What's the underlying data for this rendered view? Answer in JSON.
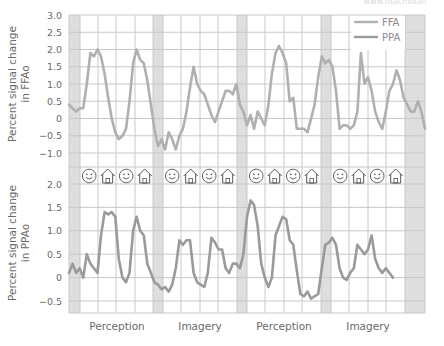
{
  "watermark": "www.macmillan",
  "colors": {
    "grid": "#c8c8c8",
    "shade": "#dedede",
    "ffa_line": "#b0b0b0",
    "ppa_line": "#9a9a9a",
    "text": "#6a6a6a"
  },
  "legend": [
    {
      "label": "FFA",
      "color": "#b0b0b0"
    },
    {
      "label": "PPA",
      "color": "#9a9a9a"
    }
  ],
  "conditions": [
    "Perception",
    "Imagery",
    "Perception",
    "Imagery"
  ],
  "stimulus_icons": [
    "face-icon",
    "house-icon",
    "face-icon",
    "house-icon",
    "face-icon",
    "house-icon",
    "face-icon",
    "house-icon",
    "face-icon",
    "house-icon",
    "face-icon",
    "house-icon",
    "face-icon",
    "house-icon",
    "face-icon",
    "house-icon"
  ],
  "chart_data": [
    {
      "type": "line",
      "title": "",
      "ylabel": "Percent signal change in FFAo",
      "xlabel": "",
      "ylim": [
        -1.0,
        3.0
      ],
      "yticks": [
        "3.0",
        "2.5",
        "2.0",
        "1.5",
        "1.0",
        "0.5",
        "0",
        "−0.5",
        "−1.0"
      ],
      "grid": true,
      "legend_position": "upper right",
      "x_range": [
        0,
        100
      ],
      "series": [
        {
          "name": "FFA",
          "x": [
            0,
            1,
            2,
            3,
            4,
            5,
            6,
            7,
            8,
            9,
            10,
            11,
            12,
            13,
            14,
            15,
            16,
            17,
            18,
            19,
            20,
            21,
            22,
            23,
            24,
            25,
            26,
            27,
            28,
            29,
            30,
            31,
            32,
            33,
            34,
            35,
            36,
            37,
            38,
            39,
            40,
            41,
            42,
            43,
            44,
            45,
            46,
            47,
            48,
            49,
            50,
            51,
            52,
            53,
            54,
            55,
            56,
            57,
            58,
            59,
            60,
            61,
            62,
            63,
            64,
            65,
            66,
            67,
            68,
            69,
            70,
            71,
            72,
            73,
            74,
            75,
            76,
            77,
            78,
            79,
            80,
            81,
            82,
            83,
            84,
            85,
            86,
            87,
            88,
            89,
            90,
            91,
            92,
            93,
            94,
            95,
            96,
            97,
            98,
            99,
            100
          ],
          "values": [
            0.4,
            0.3,
            0.2,
            0.3,
            0.3,
            1.0,
            1.9,
            1.8,
            2.0,
            1.8,
            1.3,
            0.6,
            0.0,
            -0.4,
            -0.6,
            -0.5,
            -0.3,
            0.5,
            1.6,
            2.0,
            1.7,
            1.6,
            1.1,
            0.4,
            -0.3,
            -0.8,
            -0.6,
            -0.9,
            -0.4,
            -0.6,
            -0.9,
            -0.5,
            -0.3,
            0.2,
            0.9,
            1.5,
            1.0,
            0.8,
            0.7,
            0.4,
            0.1,
            -0.1,
            0.2,
            0.5,
            0.8,
            0.8,
            0.7,
            1.0,
            0.4,
            0.2,
            -0.2,
            0.1,
            -0.3,
            0.2,
            0.0,
            -0.2,
            0.4,
            1.3,
            1.9,
            2.1,
            1.9,
            1.6,
            0.5,
            0.6,
            -0.3,
            -0.3,
            -0.3,
            -0.4,
            0.0,
            0.4,
            1.2,
            1.8,
            1.6,
            1.7,
            1.5,
            0.8,
            -0.3,
            -0.2,
            -0.2,
            -0.3,
            -0.2,
            0.2,
            1.9,
            1.0,
            1.2,
            0.8,
            0.2,
            -0.1,
            -0.3,
            0.2,
            0.8,
            1.0,
            1.4,
            1.1,
            0.6,
            0.4,
            0.2,
            0.2,
            0.5,
            0.2,
            -0.3
          ]
        }
      ]
    },
    {
      "type": "line",
      "title": "",
      "ylabel": "Percent signal change in PPAo",
      "xlabel": "",
      "ylim": [
        -0.75,
        2.0
      ],
      "yticks": [
        "2.0",
        "1.5",
        "1.0",
        "0.5",
        "0",
        "−0.5"
      ],
      "grid": true,
      "x_range": [
        0,
        100
      ],
      "series": [
        {
          "name": "PPA",
          "x": [
            0,
            1,
            2,
            3,
            4,
            5,
            6,
            7,
            8,
            9,
            10,
            11,
            12,
            13,
            14,
            15,
            16,
            17,
            18,
            19,
            20,
            21,
            22,
            23,
            24,
            25,
            26,
            27,
            28,
            29,
            30,
            31,
            32,
            33,
            34,
            35,
            36,
            37,
            38,
            39,
            40,
            41,
            42,
            43,
            44,
            45,
            46,
            47,
            48,
            49,
            50,
            51,
            52,
            53,
            54,
            55,
            56,
            57,
            58,
            59,
            60,
            61,
            62,
            63,
            64,
            65,
            66,
            67,
            68,
            69,
            70,
            71,
            72,
            73,
            74,
            75,
            76,
            77,
            78,
            79,
            80,
            81,
            82,
            83,
            84,
            85,
            86,
            87,
            88,
            89,
            90,
            91,
            92,
            93,
            94,
            95,
            96,
            97,
            98,
            99,
            100
          ],
          "values": [
            0.1,
            0.3,
            0.1,
            0.2,
            0.0,
            0.5,
            0.3,
            0.2,
            0.1,
            0.9,
            1.4,
            1.35,
            1.4,
            1.3,
            0.4,
            0.0,
            -0.1,
            0.1,
            1.0,
            1.3,
            1.0,
            0.9,
            0.3,
            0.1,
            -0.1,
            -0.15,
            -0.25,
            -0.2,
            -0.3,
            -0.15,
            0.2,
            0.8,
            0.7,
            0.8,
            0.8,
            0.1,
            -0.1,
            -0.15,
            -0.2,
            0.1,
            0.85,
            0.75,
            0.6,
            0.6,
            0.2,
            0.1,
            0.3,
            0.3,
            0.2,
            0.5,
            1.3,
            1.65,
            1.55,
            1.1,
            0.3,
            0.0,
            -0.2,
            0.0,
            0.9,
            1.1,
            1.3,
            1.25,
            0.8,
            0.7,
            0.15,
            -0.35,
            -0.4,
            -0.3,
            -0.45,
            -0.4,
            -0.35,
            0.2,
            0.7,
            0.75,
            0.85,
            0.7,
            0.2,
            0.0,
            -0.05,
            0.1,
            0.2,
            0.7,
            0.6,
            0.5,
            0.6,
            0.9,
            0.4,
            0.2,
            0.1,
            0.2,
            0.1,
            0.0
          ]
        }
      ]
    }
  ]
}
